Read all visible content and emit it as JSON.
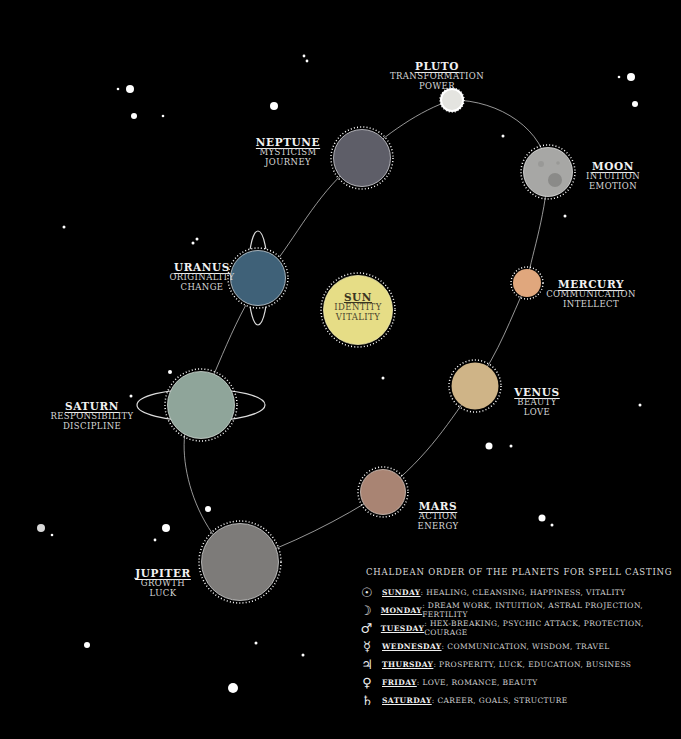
{
  "colors": {
    "background": "#000000",
    "orbit": "#bdbdbd",
    "sun": "#e6dd86",
    "pluto": "#e4e4e0",
    "moon": "#a7a7a5",
    "mercury": "#e0a77d",
    "venus": "#cfb487",
    "mars": "#a98473",
    "jupiter": "#7d7b79",
    "saturn": "#8fa59a",
    "uranus": "#3f6178",
    "neptune": "#5e5e68"
  },
  "sun": {
    "name": "SUN",
    "keywords": [
      "IDENTITY",
      "VITALITY"
    ]
  },
  "planets": [
    {
      "id": "pluto",
      "name": "PLUTO",
      "keywords": [
        "TRANSFORMATION",
        "POWER"
      ]
    },
    {
      "id": "moon",
      "name": "MOON",
      "keywords": [
        "INTUITION",
        "EMOTION"
      ]
    },
    {
      "id": "mercury",
      "name": "MERCURY",
      "keywords": [
        "COMMUNICATION",
        "INTELLECT"
      ]
    },
    {
      "id": "venus",
      "name": "VENUS",
      "keywords": [
        "BEAUTY",
        "LOVE"
      ]
    },
    {
      "id": "mars",
      "name": "MARS",
      "keywords": [
        "ACTION",
        "ENERGY"
      ]
    },
    {
      "id": "jupiter",
      "name": "JUPITER",
      "keywords": [
        "GROWTH",
        "LUCK"
      ]
    },
    {
      "id": "saturn",
      "name": "SATURN",
      "keywords": [
        "RESPONSIBILITY",
        "DISCIPLINE"
      ]
    },
    {
      "id": "uranus",
      "name": "URANUS",
      "keywords": [
        "ORIGINALITY",
        "CHANGE"
      ]
    },
    {
      "id": "neptune",
      "name": "NEPTUNE",
      "keywords": [
        "MYSTICISM",
        "JOURNEY"
      ]
    }
  ],
  "legend": {
    "title": "CHALDEAN ORDER OF THE PLANETS FOR SPELL CASTING",
    "rows": [
      {
        "symbol": "☉",
        "symbol_name": "sun-symbol-icon",
        "day": "SUNDAY",
        "desc": ": HEALING, CLEANSING, HAPPINESS, VITALITY"
      },
      {
        "symbol": "☽",
        "symbol_name": "moon-symbol-icon",
        "day": "MONDAY",
        "desc": ": DREAM WORK, INTUITION, ASTRAL PROJECTION, FERTILITY"
      },
      {
        "symbol": "♂",
        "symbol_name": "mars-symbol-icon",
        "day": "TUESDAY",
        "desc": ": HEX-BREAKING, PSYCHIC ATTACK, PROTECTION, COURAGE"
      },
      {
        "symbol": "☿",
        "symbol_name": "mercury-symbol-icon",
        "day": "WEDNESDAY",
        "desc": ": COMMUNICATION, WISDOM, TRAVEL"
      },
      {
        "symbol": "♃",
        "symbol_name": "jupiter-symbol-icon",
        "day": "THURSDAY",
        "desc": ": PROSPERITY, LUCK, EDUCATION, BUSINESS"
      },
      {
        "symbol": "♀",
        "symbol_name": "venus-symbol-icon",
        "day": "FRIDAY",
        "desc": ": LOVE, ROMANCE, BEAUTY"
      },
      {
        "symbol": "♄",
        "symbol_name": "saturn-symbol-icon",
        "day": "SATURDAY",
        "desc": ": CAREER, GOALS, STRUCTURE"
      }
    ]
  }
}
